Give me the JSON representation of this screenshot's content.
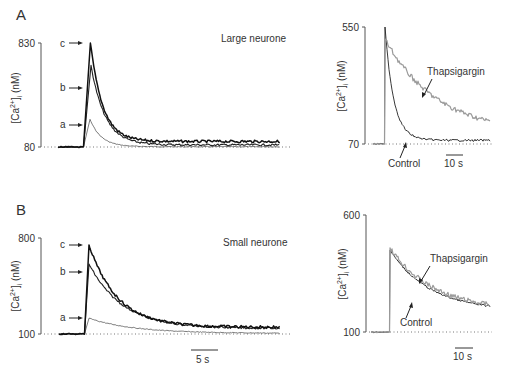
{
  "figure": {
    "panels": [
      {
        "letter": "A",
        "left_title": "Large neurone"
      },
      {
        "letter": "B",
        "left_title": "Small neurone"
      }
    ],
    "ylabel": "[Ca2+]i (nM)",
    "scale_bars": {
      "left_bottom": "5 s",
      "right_top": "10 s",
      "right_bottom": "10 s"
    }
  },
  "chart_data": [
    {
      "id": "A-left",
      "type": "line",
      "title": "Large neurone",
      "panel": "A",
      "ylabel": "[Ca2+]i (nM)",
      "ylim": [
        80,
        830
      ],
      "yticks": [
        80,
        830
      ],
      "xlabel": "time",
      "scale_bar": "5 s",
      "baseline_dotted": 80,
      "series": [
        {
          "name": "a",
          "peak": 280,
          "peak_time_s": 1.0,
          "decay_tau_s": 2.0,
          "plateau": 82,
          "style": "thin"
        },
        {
          "name": "b",
          "peak": 670,
          "peak_time_s": 1.5,
          "decay_tau_s": 2.5,
          "plateau": 95,
          "style": "medium"
        },
        {
          "name": "c",
          "peak": 830,
          "peak_time_s": 1.2,
          "decay_tau_s": 2.2,
          "plateau": 120,
          "style": "thick"
        }
      ],
      "arrows": [
        "a",
        "b",
        "c"
      ]
    },
    {
      "id": "A-right",
      "type": "line",
      "panel": "A",
      "ylabel": "[Ca2+]i (nM)",
      "ylim": [
        70,
        550
      ],
      "yticks": [
        70,
        550
      ],
      "scale_bar": "10 s",
      "baseline_dotted": 70,
      "series": [
        {
          "name": "Control",
          "peak": 550,
          "decay_tau_s": 5,
          "plateau": 85
        },
        {
          "name": "Thapsigargin",
          "peak": 500,
          "decay_tau_s": 30,
          "plateau": 110
        }
      ],
      "annotations": [
        "Thapsigargin",
        "Control"
      ]
    },
    {
      "id": "B-left",
      "type": "line",
      "title": "Small neurone",
      "panel": "B",
      "ylabel": "[Ca2+]i (nM)",
      "ylim": [
        100,
        800
      ],
      "yticks": [
        100,
        800
      ],
      "scale_bar": "5 s",
      "baseline_dotted": 100,
      "series": [
        {
          "name": "a",
          "peak": 215,
          "peak_time_s": 0.5,
          "decay_tau_s": 8,
          "plateau": 105,
          "style": "thin"
        },
        {
          "name": "b",
          "peak": 610,
          "peak_time_s": 0.5,
          "decay_tau_s": 6,
          "plateau": 140,
          "style": "medium"
        },
        {
          "name": "c",
          "peak": 750,
          "peak_time_s": 0.5,
          "decay_tau_s": 5,
          "plateau": 150,
          "style": "thick"
        }
      ],
      "arrows": [
        "a",
        "b",
        "c"
      ]
    },
    {
      "id": "B-right",
      "type": "line",
      "panel": "B",
      "ylabel": "[Ca2+]i (nM)",
      "ylim": [
        100,
        600
      ],
      "yticks": [
        100,
        600
      ],
      "scale_bar": "10 s",
      "baseline_dotted": 100,
      "series": [
        {
          "name": "Control",
          "peak": 450,
          "decay_tau_s": 20,
          "plateau": 190
        },
        {
          "name": "Thapsigargin",
          "peak": 460,
          "decay_tau_s": 20,
          "plateau": 190
        }
      ],
      "annotations": [
        "Thapsigargin",
        "Control"
      ]
    }
  ],
  "labels": {
    "A": "A",
    "B": "B",
    "large": "Large neurone",
    "small": "Small neurone",
    "yA1_top": "830",
    "yA1_bot": "80",
    "yA2_top": "550",
    "yA2_bot": "70",
    "yB1_top": "800",
    "yB1_bot": "100",
    "yB2_top": "600",
    "yB2_bot": "100",
    "ylabel_main": "[Ca",
    "ylabel_sup": "2+",
    "ylabel_end": "]",
    "ylabel_sub": "i",
    "ylabel_unit": " (nM)",
    "a": "a",
    "b": "b",
    "c": "c",
    "thapsigargin": "Thapsigargin",
    "control": "Control",
    "sb5": "5 s",
    "sb10a": "10 s",
    "sb10b": "10 s"
  }
}
